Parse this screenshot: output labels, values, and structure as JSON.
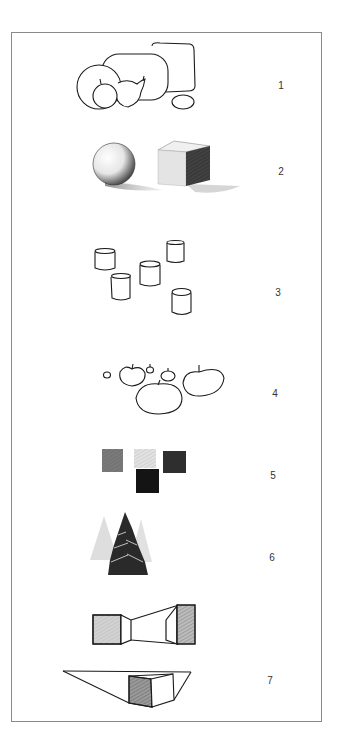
{
  "figure": {
    "border_color": "#8a8a8a",
    "label_color": "#333333",
    "items": [
      {
        "number": "1",
        "subject": "still-life-outline",
        "label_x": 281,
        "label_y": 86
      },
      {
        "number": "2",
        "subject": "shaded-sphere-and-cube",
        "label_x": 281,
        "label_y": 172
      },
      {
        "number": "3",
        "subject": "cylinders",
        "label_x": 278,
        "label_y": 293
      },
      {
        "number": "4",
        "subject": "apples-of-varying-size",
        "label_x": 275,
        "label_y": 394
      },
      {
        "number": "5",
        "subject": "tonal-squares",
        "label_x": 273,
        "label_y": 476
      },
      {
        "number": "6",
        "subject": "fir-trees-aerial-perspective",
        "label_x": 272,
        "label_y": 558
      },
      {
        "number": "7",
        "subject": "perspective-boxes",
        "label_x": 270,
        "label_y": 681
      }
    ]
  }
}
